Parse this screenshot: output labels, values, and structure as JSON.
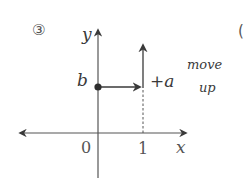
{
  "figure": {
    "index_label": "③",
    "next_index_partial": "(",
    "axes": {
      "x_label": "x",
      "y_label": "y",
      "origin_label": "0",
      "x_tick_label": "1"
    },
    "point": {
      "label": "b",
      "description": "y-intercept point at (0, b)"
    },
    "shift": {
      "label": "+a",
      "annotation_line1": "move",
      "annotation_line2": "up"
    },
    "colors": {
      "ink": "#3a3a3a",
      "axis": "#555555",
      "background": "#ffffff"
    }
  }
}
